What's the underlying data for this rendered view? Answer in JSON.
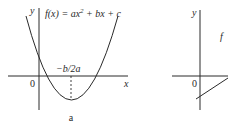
{
  "panels": [
    {
      "id": "a",
      "caption": "a",
      "y_axis_label": "y",
      "x_axis_label": "x",
      "origin_label": "0",
      "function_label": "f(x) = ax² + bx + c",
      "function_parts": {
        "lhs": "f(x)",
        "eq": " = ",
        "t1": "ax",
        "sup": "2",
        "rest": " + bx + c"
      },
      "vertex_label": "−b/2a",
      "curve": "parabola opening upward, vertex below x-axis, positive y-intercept, two positive roots"
    },
    {
      "id": "b",
      "y_axis_label": "y",
      "origin_label": "0",
      "function_label": "f",
      "curve": "line with positive slope, negative y-intercept (partially cropped)"
    }
  ],
  "colors": {
    "ink": "#2a2a2a",
    "background": "#ffffff"
  }
}
